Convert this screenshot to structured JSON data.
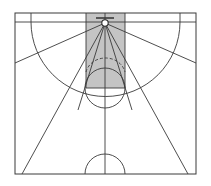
{
  "figure": {
    "background_color": "#ffffff",
    "line_color": "#3a3a3a",
    "shaded_zone_color": "#c4c4c4",
    "width": 211,
    "height": 186
  },
  "chart_data": {
    "type": "diagram",
    "subtitle": "",
    "xlabel": "",
    "ylabel": "",
    "grid": false,
    "legend_position": "none",
    "units": "pixels",
    "xlim": [
      0,
      211
    ],
    "ylim": [
      0,
      186
    ],
    "annotations": [],
    "court": {
      "left_sideline_x": 15,
      "right_sideline_x": 196,
      "baseline_y": 13,
      "halfcourt_line_y": 174,
      "line_color": "#3a3a3a",
      "line_width": 1
    },
    "hoop": {
      "center_x": 105,
      "center_y": 23,
      "rim_radius": 3.2,
      "backboard_y": 18,
      "backboard_half_width": 9
    },
    "paint": {
      "label": "key / paint",
      "left_x": 86,
      "right_x": 125,
      "top_y": 13,
      "bottom_y": 88,
      "fill": "#c4c4c4",
      "stroke": "#3a3a3a"
    },
    "free_throw_circle": {
      "center_x": 105,
      "center_y": 88,
      "radius": 20,
      "upper_half_dashed": false,
      "lower_half_solid": true
    },
    "dashed_arc": {
      "label": "restricted area arc",
      "center_x": 105,
      "center_y": 23,
      "radius": 42,
      "dash_pattern": "3,2",
      "start_angle_deg": 20,
      "end_angle_deg": 160
    },
    "corner_three_line_y": 22,
    "corner_boxes": [
      {
        "label": "left-corner-box",
        "x": 15,
        "y": 13,
        "width": 16,
        "height": 9
      },
      {
        "label": "right-corner-box",
        "x": 180,
        "y": 13,
        "width": 16,
        "height": 9
      }
    ],
    "three_point_arc": {
      "center_x": 105,
      "center_y": 23,
      "radius": 90,
      "left_corner_x": 31,
      "right_corner_x": 180,
      "corner_line_y": 22
    },
    "center_circle": {
      "center_x": 105,
      "center_y": 174,
      "radius": 20,
      "half": "upper"
    },
    "radiating_zone_lines": [
      {
        "label": "zone-line-far-left",
        "from": [
          105,
          23
        ],
        "to": [
          15,
          63
        ]
      },
      {
        "label": "zone-line-left",
        "from": [
          105,
          23
        ],
        "to": [
          22,
          174
        ]
      },
      {
        "label": "zone-line-left-inner",
        "from": [
          105,
          23
        ],
        "to": [
          78,
          110
        ]
      },
      {
        "label": "zone-line-right-inner",
        "from": [
          105,
          23
        ],
        "to": [
          132,
          110
        ]
      },
      {
        "label": "zone-line-right",
        "from": [
          105,
          23
        ],
        "to": [
          188,
          174
        ]
      },
      {
        "label": "zone-line-far-right",
        "from": [
          105,
          23
        ],
        "to": [
          196,
          63
        ]
      }
    ]
  }
}
